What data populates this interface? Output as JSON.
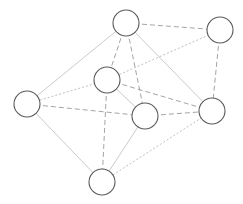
{
  "diagram": {
    "type": "undirected-graph",
    "width": 243,
    "height": 204,
    "node_radius": 13,
    "colors": {
      "background": "#ffffff",
      "node_stroke": "#5a5a5a",
      "node_fill": "#ffffff",
      "edge_dashed": "#9a9a9a",
      "edge_solid": "#c4c4c4",
      "edge_dotted": "#b8b8b8"
    },
    "nodes": [
      {
        "id": "top",
        "x": 126,
        "y": 23
      },
      {
        "id": "right-top",
        "x": 220,
        "y": 30
      },
      {
        "id": "middle-upper",
        "x": 107,
        "y": 80
      },
      {
        "id": "left",
        "x": 27,
        "y": 104
      },
      {
        "id": "right-middle",
        "x": 212,
        "y": 111
      },
      {
        "id": "lower-middle",
        "x": 145,
        "y": 116
      },
      {
        "id": "bottom",
        "x": 102,
        "y": 182
      }
    ],
    "edges": [
      {
        "from": "top",
        "to": "right-top",
        "style": "dashed"
      },
      {
        "from": "top",
        "to": "middle-upper",
        "style": "dashed"
      },
      {
        "from": "top",
        "to": "lower-middle",
        "style": "dashed"
      },
      {
        "from": "top",
        "to": "right-middle",
        "style": "solid"
      },
      {
        "from": "top",
        "to": "left",
        "style": "solid"
      },
      {
        "from": "right-top",
        "to": "middle-upper",
        "style": "dotted"
      },
      {
        "from": "right-top",
        "to": "right-middle",
        "style": "dashed"
      },
      {
        "from": "middle-upper",
        "to": "left",
        "style": "dotted"
      },
      {
        "from": "middle-upper",
        "to": "lower-middle",
        "style": "solid"
      },
      {
        "from": "middle-upper",
        "to": "right-middle",
        "style": "dashed"
      },
      {
        "from": "middle-upper",
        "to": "bottom",
        "style": "dashed"
      },
      {
        "from": "left",
        "to": "lower-middle",
        "style": "dashed"
      },
      {
        "from": "left",
        "to": "bottom",
        "style": "solid"
      },
      {
        "from": "lower-middle",
        "to": "right-middle",
        "style": "dashed"
      },
      {
        "from": "lower-middle",
        "to": "bottom",
        "style": "solid"
      },
      {
        "from": "right-middle",
        "to": "bottom",
        "style": "dotted"
      }
    ]
  }
}
